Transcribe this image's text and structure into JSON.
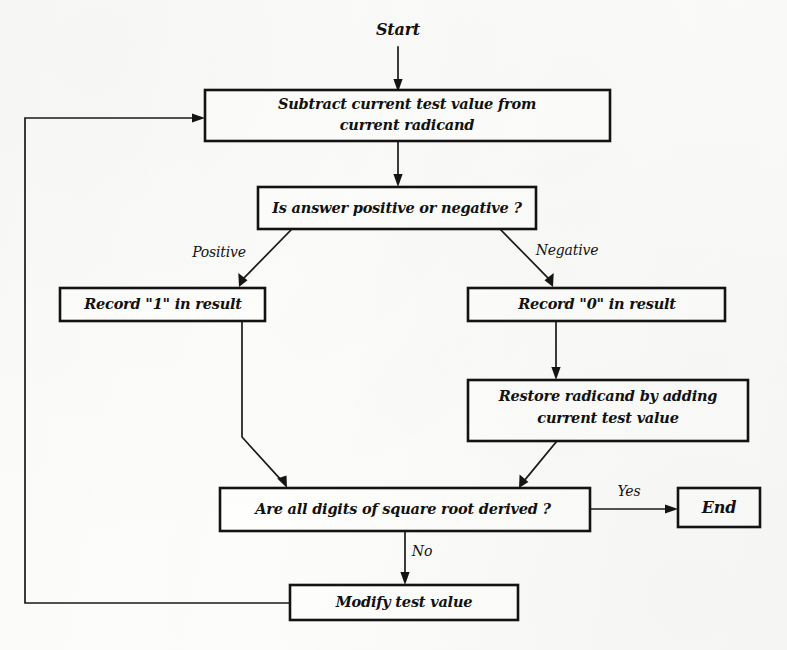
{
  "diagram": {
    "kind": "flowchart",
    "ink_color": "#131313",
    "paper_color": "#fdfdfb"
  },
  "nodes": {
    "start": {
      "label": "Start",
      "shape": "text-terminator"
    },
    "subtract": {
      "label_line1": "Subtract current test value from",
      "label_line2": "current radicand",
      "shape": "rectangle"
    },
    "decision_sign": {
      "label": "Is answer positive or negative ?",
      "shape": "rectangle"
    },
    "record_one": {
      "label": "Record \"1\" in result",
      "shape": "rectangle"
    },
    "record_zero": {
      "label": "Record \"0\" in result",
      "shape": "rectangle"
    },
    "restore": {
      "label_line1": "Restore radicand by adding",
      "label_line2": "current test value",
      "shape": "rectangle"
    },
    "decision_digits": {
      "label": "Are all digits of square root derived ?",
      "shape": "rectangle"
    },
    "modify": {
      "label": "Modify test value",
      "shape": "rectangle"
    },
    "end": {
      "label": "End",
      "shape": "rectangle"
    }
  },
  "edge_labels": {
    "positive": "Positive",
    "negative": "Negative",
    "yes": "Yes",
    "no": "No"
  },
  "edges": [
    {
      "from": "start",
      "to": "subtract",
      "label": ""
    },
    {
      "from": "subtract",
      "to": "decision_sign",
      "label": ""
    },
    {
      "from": "decision_sign",
      "to": "record_one",
      "label": "Positive"
    },
    {
      "from": "decision_sign",
      "to": "record_zero",
      "label": "Negative"
    },
    {
      "from": "record_one",
      "to": "decision_digits",
      "label": ""
    },
    {
      "from": "record_zero",
      "to": "restore",
      "label": ""
    },
    {
      "from": "restore",
      "to": "decision_digits",
      "label": ""
    },
    {
      "from": "decision_digits",
      "to": "end",
      "label": "Yes"
    },
    {
      "from": "decision_digits",
      "to": "modify",
      "label": "No"
    },
    {
      "from": "modify",
      "to": "subtract",
      "label": ""
    }
  ]
}
